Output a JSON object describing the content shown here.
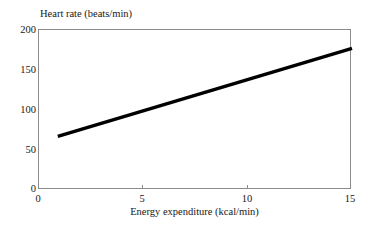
{
  "figure": {
    "background_color": "#ffffff",
    "frame_color": "#8b8b8b",
    "line_color": "#000000"
  },
  "chart_data": {
    "type": "line",
    "title": "",
    "subtitle": "",
    "xlabel": "Energy expenditure (kcal/min)",
    "ylabel": "Heart rate (beats/min)",
    "ylabel_position": "above-axis",
    "xlim": [
      0,
      15
    ],
    "ylim": [
      0,
      200
    ],
    "xticks": [
      0,
      5,
      10,
      15
    ],
    "xticklabels": [
      "0",
      "5",
      "10",
      "15"
    ],
    "yticks": [
      0,
      50,
      100,
      150,
      200
    ],
    "yticklabels": [
      "0",
      "50",
      "100",
      "150",
      "200"
    ],
    "grid": false,
    "legend": null,
    "annotations": [],
    "series": [
      {
        "name": "Heart rate vs energy expenditure",
        "color": "#000000",
        "linewidth": 3,
        "x": [
          0.9,
          15.0
        ],
        "y": [
          67,
          177
        ]
      }
    ]
  }
}
